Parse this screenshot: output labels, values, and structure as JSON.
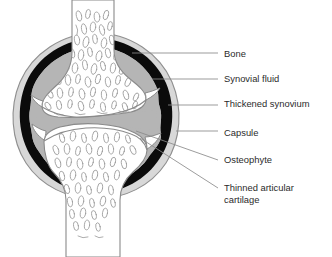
{
  "figure": {
    "background_color": "#ffffff",
    "colors": {
      "bone_fill": "#ffffff",
      "bone_outline": "#8a8a8a",
      "trabecula_line": "#9a9a9a",
      "synovium_black": "#0b0b0b",
      "synovial_fluid_gray": "#b5b5b5",
      "capsule_outer": "#c9c9c9",
      "cartilage_gray": "#b5b5b5",
      "leader_line": "#8a8a8a",
      "text": "#2b2b2b"
    }
  },
  "labels": [
    {
      "id": "bone",
      "text": "Bone",
      "text_x": 224,
      "text_y": 57,
      "leader": {
        "x1": 132,
        "y1": 53,
        "x2": 218,
        "y2": 53
      }
    },
    {
      "id": "synovial-fluid",
      "text": "Synovial fluid",
      "text_x": 224,
      "text_y": 82,
      "leader": {
        "x1": 152,
        "y1": 79,
        "x2": 218,
        "y2": 79
      }
    },
    {
      "id": "thickened-synovium",
      "text": "Thickened synovium",
      "text_x": 224,
      "text_y": 107,
      "leader": {
        "x1": 168,
        "y1": 105,
        "x2": 218,
        "y2": 105
      }
    },
    {
      "id": "capsule",
      "text": "Capsule",
      "text_x": 224,
      "text_y": 136,
      "leader": {
        "x1": 176,
        "y1": 131,
        "x2": 218,
        "y2": 131
      }
    },
    {
      "id": "osteophyte",
      "text": "Osteophyte",
      "text_x": 224,
      "text_y": 163,
      "leader": {
        "x1": 136,
        "y1": 131,
        "x2": 218,
        "y2": 160
      }
    },
    {
      "id": "thinned-articular-cartilage",
      "text_line1": "Thinned articular",
      "text_line2": "cartilage",
      "text_x": 224,
      "text_y": 191,
      "text_y2": 203,
      "leader": {
        "x1": 140,
        "y1": 138,
        "x2": 218,
        "y2": 188
      }
    }
  ],
  "structures": [
    {
      "id": "upper-bone",
      "name": "Bone (upper, femur)"
    },
    {
      "id": "lower-bone",
      "name": "Bone (lower, tibia)"
    },
    {
      "id": "joint-capsule",
      "name": "Capsule"
    },
    {
      "id": "synovium",
      "name": "Thickened synovium"
    },
    {
      "id": "synovial-fluid-space",
      "name": "Synovial fluid"
    },
    {
      "id": "articular-cartilage",
      "name": "Thinned articular cartilage"
    },
    {
      "id": "osteophyte-left",
      "name": "Osteophyte (left spur)"
    },
    {
      "id": "osteophyte-right",
      "name": "Osteophyte (right spur)"
    }
  ]
}
